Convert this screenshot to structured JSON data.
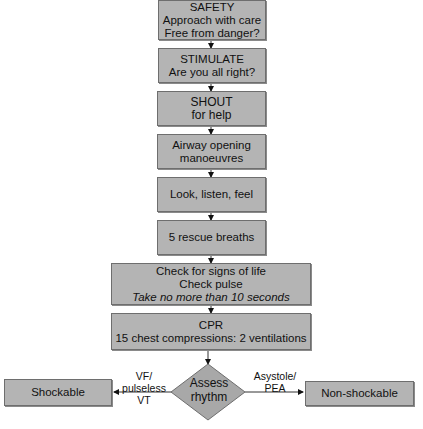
{
  "flowchart": {
    "steps": [
      {
        "id": "safety",
        "lines": [
          "SAFETY",
          "Approach with care",
          "Free from danger?"
        ]
      },
      {
        "id": "stimulate",
        "lines": [
          "STIMULATE",
          "Are you all right?"
        ]
      },
      {
        "id": "shout",
        "lines": [
          "SHOUT",
          "for help"
        ]
      },
      {
        "id": "airway",
        "lines": [
          "Airway opening",
          "manoeuvres"
        ]
      },
      {
        "id": "look",
        "lines": [
          "Look, listen, feel"
        ]
      },
      {
        "id": "rescue",
        "lines": [
          "5 rescue breaths"
        ]
      },
      {
        "id": "check",
        "lines": [
          "Check for signs of life",
          "Check pulse",
          "Take no more than 10 seconds"
        ]
      },
      {
        "id": "cpr",
        "lines": [
          "CPR",
          "15 chest compressions: 2  ventilations"
        ]
      }
    ],
    "decision": {
      "lines": [
        "Assess",
        "rhythm"
      ]
    },
    "branches": {
      "left": {
        "label_lines": [
          "VF/",
          "pulseless VT"
        ],
        "target": "Shockable"
      },
      "right": {
        "label_lines": [
          "Asystole/",
          "PEA"
        ],
        "target": "Non-shockable"
      }
    },
    "colors": {
      "box_fill": "#b4b4b4",
      "box_border": "#6e6e6e",
      "arrow": "#111111"
    }
  }
}
